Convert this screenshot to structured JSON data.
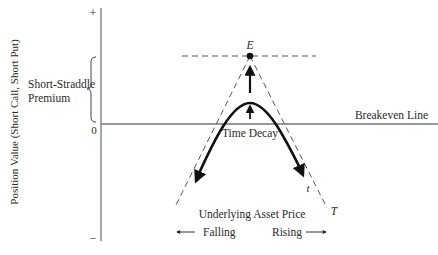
{
  "diagram": {
    "y_axis": {
      "label": "Position Value (Short Call, Short Put)",
      "plus_marker": "+",
      "zero_marker": "0",
      "minus_marker": "–"
    },
    "bracket_label_line1": "Short-Straddle",
    "bracket_label_line2": "Premium",
    "breakeven_label": "Breakeven Line",
    "peak_point_label": "E",
    "time_decay_label": "Time Decay",
    "curve_t_label": "t",
    "expiration_T_label": "T",
    "x_axis": {
      "label": "Underlying Asset Price",
      "left_direction": "Falling",
      "right_direction": "Rising"
    },
    "colors": {
      "line": "#333333",
      "axis": "#777777",
      "dashed": "#555555",
      "curve": "#111111"
    }
  }
}
